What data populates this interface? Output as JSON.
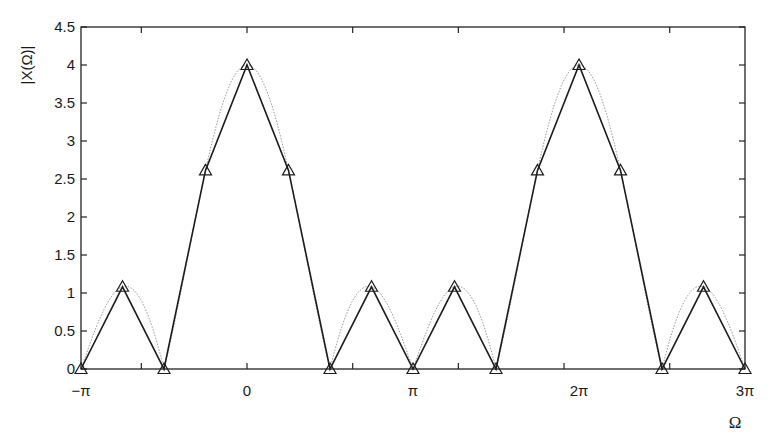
{
  "chart_data": {
    "type": "line",
    "title": "",
    "xlabel": "Ω",
    "ylabel": "|X(Ω)|",
    "xlim_pi": [
      -1,
      3
    ],
    "ylim": [
      0,
      4.5
    ],
    "grid": false,
    "legend": null,
    "x_tick_labels": [
      {
        "value_pi": -1,
        "label": "−π"
      },
      {
        "value_pi": 0,
        "label": "0"
      },
      {
        "value_pi": 1,
        "label": "π"
      },
      {
        "value_pi": 2,
        "label": "2π"
      },
      {
        "value_pi": 3,
        "label": "3π"
      }
    ],
    "x_minor_ticks_rad": [
      -2,
      0,
      2,
      4,
      6,
      8
    ],
    "y_ticks": [
      0,
      0.5,
      1,
      1.5,
      2,
      2.5,
      3,
      3.5,
      4,
      4.5
    ],
    "y_tick_labels": [
      "0",
      "0.5",
      "1",
      "1.5",
      "2",
      "2.5",
      "3",
      "3.5",
      "4",
      "4.5"
    ],
    "series": [
      {
        "name": "sampled |X(Ω)| (triangles, solid)",
        "style": "solid-with-triangle-markers",
        "x_pi": [
          -1,
          -0.75,
          -0.5,
          -0.25,
          0,
          0.25,
          0.5,
          0.75,
          1,
          1.25,
          1.5,
          1.75,
          2,
          2.25,
          2.5,
          2.75,
          3
        ],
        "values": [
          0,
          1.082,
          0,
          2.613,
          4,
          2.613,
          0,
          1.082,
          0,
          1.082,
          0,
          2.613,
          4,
          2.613,
          0,
          1.082,
          0
        ]
      },
      {
        "name": "continuous |X(Ω)| (dotted)",
        "style": "dotted",
        "formula": "|sin(2Ω)/sin(Ω/2)|",
        "x_pi_range": [
          -1,
          3
        ]
      }
    ]
  },
  "axes": {
    "xlabel": "Ω",
    "ylabel": "|X(Ω)|"
  }
}
